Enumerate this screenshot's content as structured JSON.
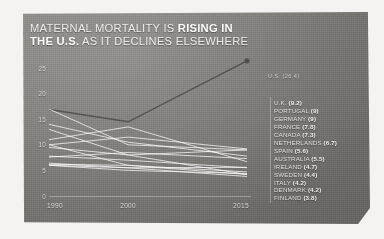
{
  "title": {
    "line1_plain": "MATERNAL MORTALITY IS ",
    "line1_bold": "RISING IN",
    "line2_bold": "THE U.S.",
    "line2_plain": " AS IT DECLINES ELSEWHERE"
  },
  "us_endpoint_label": "U.S. (26.4)",
  "legend": {
    "items": [
      {
        "country": "U.K.",
        "value": "(9.2)"
      },
      {
        "country": "PORTUGAL",
        "value": "(9)"
      },
      {
        "country": "GERMANY",
        "value": "(9)"
      },
      {
        "country": "FRANCE",
        "value": "(7.8)"
      },
      {
        "country": "CANADA",
        "value": "(7.3)"
      },
      {
        "country": "NETHERLANDS",
        "value": "(6.7)"
      },
      {
        "country": "SPAIN",
        "value": "(5.6)"
      },
      {
        "country": "AUSTRALIA",
        "value": "(5.5)"
      },
      {
        "country": "IRELAND",
        "value": "(4.7)"
      },
      {
        "country": "SWEDEN",
        "value": "(4.4)"
      },
      {
        "country": "ITALY",
        "value": "(4.2)"
      },
      {
        "country": "DENMARK",
        "value": "(4.2)"
      },
      {
        "country": "FINLAND",
        "value": "(3.8)"
      }
    ]
  },
  "colors": {
    "panel_bg": "#83827f",
    "title_text": "#ececea",
    "line_other": "#ffffff",
    "line_us": "#4a4947",
    "axis": "#ffffff"
  },
  "chart_data": {
    "type": "line",
    "title": "MATERNAL MORTALITY IS RISING IN THE U.S. AS IT DECLINES ELSEWHERE",
    "xlabel": "",
    "ylabel": "",
    "x": [
      1990,
      2000,
      2015
    ],
    "xlim": [
      1990,
      2015
    ],
    "ylim": [
      0,
      25
    ],
    "yticks": [
      25,
      20,
      15,
      10,
      5,
      0
    ],
    "xticks": [
      1990,
      2000,
      2015
    ],
    "xtick_labels": [
      "1990",
      "2000",
      "2015"
    ],
    "ytick_labels": [
      "25",
      "20",
      "15",
      "10",
      "5",
      "0"
    ],
    "grid": false,
    "legend_position": "right",
    "highlight_series": "U.S.",
    "series": [
      {
        "name": "U.S.",
        "values": [
          16.9,
          14.5,
          26.4
        ],
        "highlight": true
      },
      {
        "name": "U.K.",
        "values": [
          10.0,
          11.5,
          9.2
        ]
      },
      {
        "name": "PORTUGAL",
        "values": [
          17.0,
          10.0,
          9.0
        ]
      },
      {
        "name": "GERMANY",
        "values": [
          13.0,
          8.0,
          9.0
        ]
      },
      {
        "name": "FRANCE",
        "values": [
          14.0,
          10.5,
          7.8
        ]
      },
      {
        "name": "CANADA",
        "values": [
          7.6,
          8.5,
          7.3
        ]
      },
      {
        "name": "NETHERLANDS",
        "values": [
          11.0,
          13.5,
          6.7
        ]
      },
      {
        "name": "SPAIN",
        "values": [
          6.4,
          5.5,
          5.6
        ]
      },
      {
        "name": "AUSTRALIA",
        "values": [
          7.8,
          7.0,
          5.5
        ]
      },
      {
        "name": "IRELAND",
        "values": [
          6.2,
          6.0,
          4.7
        ]
      },
      {
        "name": "SWEDEN",
        "values": [
          6.0,
          5.0,
          4.4
        ]
      },
      {
        "name": "ITALY",
        "values": [
          10.0,
          6.0,
          4.2
        ]
      },
      {
        "name": "DENMARK",
        "values": [
          9.5,
          8.0,
          4.2
        ]
      },
      {
        "name": "FINLAND",
        "values": [
          6.0,
          5.5,
          3.8
        ]
      }
    ]
  }
}
